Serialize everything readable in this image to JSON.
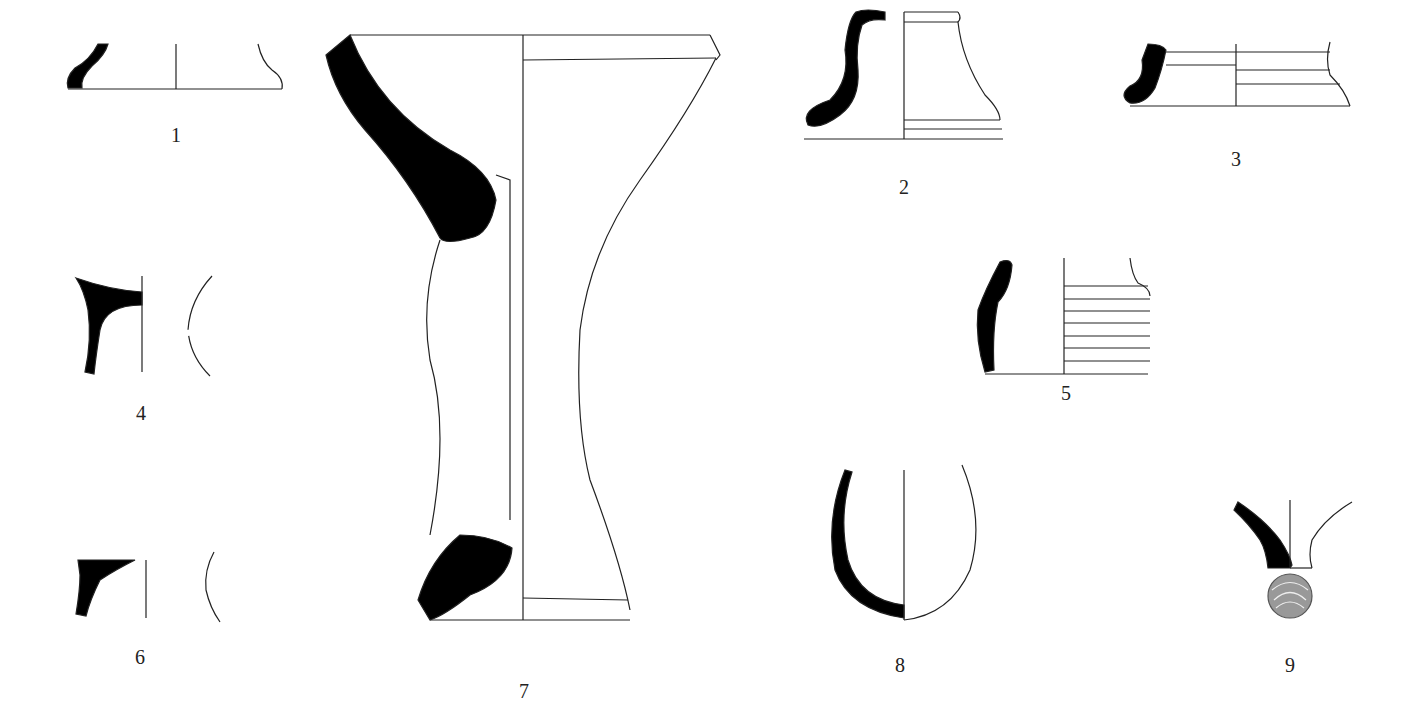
{
  "figure": {
    "type": "pottery profile drawings",
    "colors": {
      "section": "#000000",
      "outline": "#222222",
      "background": "#ffffff"
    },
    "items": [
      {
        "id": "1",
        "label": "1",
        "x": 176,
        "y": 138
      },
      {
        "id": "2",
        "label": "2",
        "x": 904,
        "y": 190
      },
      {
        "id": "3",
        "label": "3",
        "x": 1236,
        "y": 162
      },
      {
        "id": "4",
        "label": "4",
        "x": 141,
        "y": 416
      },
      {
        "id": "5",
        "label": "5",
        "x": 1066,
        "y": 400
      },
      {
        "id": "6",
        "label": "6",
        "x": 140,
        "y": 662
      },
      {
        "id": "7",
        "label": "7",
        "x": 524,
        "y": 696
      },
      {
        "id": "8",
        "label": "8",
        "x": 900,
        "y": 670
      },
      {
        "id": "9",
        "label": "9",
        "x": 1290,
        "y": 670
      }
    ]
  }
}
